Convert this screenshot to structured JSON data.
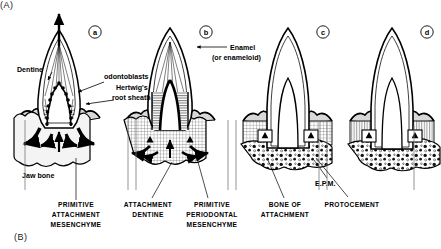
{
  "figure": {
    "part_a_marker": "(A)",
    "part_b_marker": "(B)",
    "panel_labels": [
      "a",
      "b",
      "c",
      "d"
    ]
  },
  "annotations": {
    "dentine": "Dentine",
    "odontoblasts": "odontoblasts",
    "hertwigs": "Hertwig's",
    "root_sheath": "root sheath",
    "enamel": "Enamel",
    "enameloid": "(or enameloid)",
    "jaw_bone": "Jaw bone",
    "epm": "E.P.M."
  },
  "captions": [
    {
      "lines": [
        "PRIMITIVE",
        "ATTACHMENT",
        "MESENCHYME"
      ]
    },
    {
      "lines": [
        "ATTACHMENT",
        "DENTINE"
      ]
    },
    {
      "lines": [
        "PRIMITIVE",
        "PERIODONTAL",
        "MESENCHYME"
      ]
    },
    {
      "lines": [
        "BONE OF",
        "ATTACHMENT"
      ]
    },
    {
      "lines": [
        "PROTOCEMENT"
      ]
    }
  ],
  "colors": {
    "ink": "#000000",
    "background": "#ffffff",
    "tissue_fill": "#f2f2f2",
    "hatch": "#1a1a1a"
  }
}
